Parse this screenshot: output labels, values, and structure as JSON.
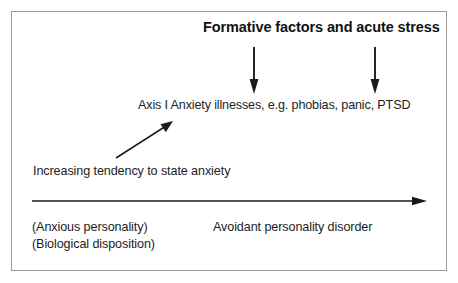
{
  "figure": {
    "title": "Formative factors and acute stress",
    "outcome_line": "Axis I Anxiety illnesses, e.g. phobias, panic, PTSD",
    "gradient_label": "Increasing tendency to state anxiety",
    "left_labels": {
      "line1": "(Anxious personality)",
      "line2": "(Biological disposition)"
    },
    "right_label": "Avoidant personality disorder",
    "colors": {
      "border": "#9a9a9a",
      "text": "#1d1d1d",
      "title_text": "#111111",
      "stroke": "#1a1a1a",
      "background": "#ffffff"
    },
    "arrows": {
      "down_left": "down-arrow-formative-left",
      "down_right": "down-arrow-formative-right",
      "diagonal": "diagonal-arrow-increasing-anxiety",
      "horizontal": "horizontal-severity-axis-arrow"
    }
  }
}
